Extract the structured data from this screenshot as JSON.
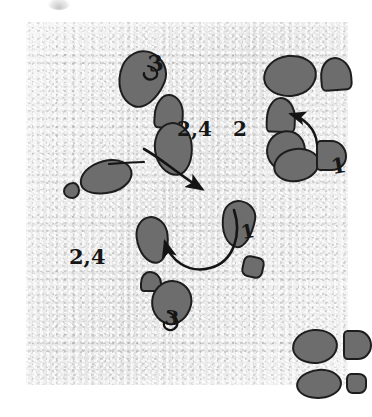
{
  "figure": {
    "paper_color": "#e9e9e9",
    "blob_fill": "#6d6d6d",
    "blob_outline": "#1d1d1d",
    "ink_color": "#161616",
    "scan_mark": "scan-artifact"
  },
  "labels": [
    {
      "id": "label-3-top",
      "text": "3",
      "x": 122,
      "y": 30,
      "size": 22,
      "rotate": -8
    },
    {
      "id": "label-2-4-center",
      "text": "2,4",
      "x": 151,
      "y": 97,
      "size": 20,
      "rotate": 0
    },
    {
      "id": "label-2-right",
      "text": "2",
      "x": 207,
      "y": 97,
      "size": 20,
      "rotate": 0
    },
    {
      "id": "label-1-right",
      "text": "1",
      "x": 305,
      "y": 133,
      "size": 21,
      "rotate": -10
    },
    {
      "id": "label-1-center",
      "text": "1",
      "x": 215,
      "y": 200,
      "size": 19,
      "rotate": -12
    },
    {
      "id": "label-2-4-left",
      "text": "2,4",
      "x": 43,
      "y": 224,
      "size": 21,
      "rotate": 0
    },
    {
      "id": "label-3-bottom",
      "text": "3",
      "x": 139,
      "y": 286,
      "size": 20,
      "rotate": 6
    }
  ],
  "blobs": [
    {
      "id": "blob-top-left-large",
      "x": 92,
      "y": 28,
      "w": 43,
      "h": 54,
      "rx": "48% 52% 44% 56% / 42% 40% 60% 58%",
      "rot": 22
    },
    {
      "id": "blob-top-left-small",
      "x": 128,
      "y": 72,
      "w": 26,
      "h": 31,
      "rx": "48% 52% 14% 16% / 62% 58% 20% 20%",
      "rot": 4
    },
    {
      "id": "blob-center-upper",
      "x": 128,
      "y": 100,
      "w": 35,
      "h": 50,
      "rx": "50% 50% 46% 54% / 48% 44% 56% 52%",
      "rot": -6
    },
    {
      "id": "blob-left-ellipse",
      "x": 53,
      "y": 138,
      "w": 50,
      "h": 30,
      "rx": "52% 48% 46% 54% / 54% 50% 50% 46%",
      "rot": -14
    },
    {
      "id": "blob-left-dot",
      "x": 37,
      "y": 160,
      "w": 13,
      "h": 13,
      "rx": "60% 40% 44% 56% / 56% 50% 50% 44%",
      "rot": 0
    },
    {
      "id": "blob-top-right-large",
      "x": 237,
      "y": 33,
      "w": 50,
      "h": 38,
      "rx": "50% 50% 48% 52% / 52% 48% 52% 48%",
      "rot": -6
    },
    {
      "id": "blob-top-right-small",
      "x": 294,
      "y": 35,
      "w": 28,
      "h": 30,
      "rx": "46% 54% 18% 16% / 58% 60% 22% 20%",
      "rot": -4
    },
    {
      "id": "blob-right-mid-small",
      "x": 240,
      "y": 75,
      "w": 26,
      "h": 32,
      "rx": "48% 52% 14% 14% / 62% 60% 20% 20%",
      "rot": 2
    },
    {
      "id": "blob-right-pair-upper",
      "x": 240,
      "y": 108,
      "w": 36,
      "h": 38,
      "rx": "52% 48% 46% 54% / 50% 52% 48% 50%",
      "rot": 14
    },
    {
      "id": "blob-right-pair-lower",
      "x": 247,
      "y": 126,
      "w": 43,
      "h": 30,
      "rx": "48% 52% 50% 50% / 52% 48% 52% 48%",
      "rot": -10
    },
    {
      "id": "blob-right-tab",
      "x": 290,
      "y": 118,
      "w": 27,
      "h": 27,
      "rx": "16% 52% 50% 14% / 16% 54% 48% 16%",
      "rot": 0
    },
    {
      "id": "blob-center-teardrop",
      "x": 195,
      "y": 178,
      "w": 30,
      "h": 44,
      "rx": "46% 54% 42% 58% / 36% 34% 66% 64%",
      "rot": 10
    },
    {
      "id": "blob-center-small-sq",
      "x": 216,
      "y": 234,
      "w": 18,
      "h": 18,
      "rx": "30% 34% 30% 34% / 32% 30% 34% 32%",
      "rot": 12
    },
    {
      "id": "blob-lower-left-oval",
      "x": 110,
      "y": 194,
      "w": 29,
      "h": 44,
      "rx": "48% 52% 44% 56% / 40% 42% 58% 60%",
      "rot": -6
    },
    {
      "id": "blob-lower-left-tiny",
      "x": 114,
      "y": 249,
      "w": 18,
      "h": 17,
      "rx": "44% 56% 18% 18% / 58% 60% 22% 22%",
      "rot": 0
    },
    {
      "id": "blob-bottom-center",
      "x": 125,
      "y": 258,
      "w": 37,
      "h": 41,
      "rx": "50% 50% 46% 54% / 48% 46% 54% 52%",
      "rot": 14
    },
    {
      "id": "blob-bottom-right-1",
      "x": 266,
      "y": 307,
      "w": 42,
      "h": 31,
      "rx": "50% 50% 48% 52% / 52% 48% 52% 48%",
      "rot": -4
    },
    {
      "id": "blob-bottom-right-2",
      "x": 317,
      "y": 308,
      "w": 25,
      "h": 26,
      "rx": "16% 50% 50% 16% / 18% 52% 50% 18%",
      "rot": 0
    },
    {
      "id": "blob-bottom-right-3",
      "x": 270,
      "y": 347,
      "w": 42,
      "h": 26,
      "rx": "52% 48% 48% 52% / 50% 52% 48% 50%",
      "rot": -5
    },
    {
      "id": "blob-bottom-right-4",
      "x": 320,
      "y": 351,
      "w": 17,
      "h": 17,
      "rx": "24% 40% 36% 32% / 30% 32% 36% 34%",
      "rot": 0
    }
  ],
  "arrows": [
    {
      "id": "arrow-center-to-teardrop",
      "from": "blob-center-upper",
      "to": "blob-center-teardrop",
      "style": "curved-arrow"
    },
    {
      "id": "arrow-loop-up-left",
      "from": "blob-center-teardrop",
      "to": "blob-lower-left-oval",
      "style": "curved-arrow"
    },
    {
      "id": "arrow-right-up-left",
      "from": "blob-right-tab",
      "to": "blob-right-mid-small",
      "style": "curved-arrow"
    },
    {
      "id": "leader-left-ellipse",
      "from": "blob-left-ellipse",
      "to": "blob-center-upper",
      "style": "leader-line"
    }
  ]
}
